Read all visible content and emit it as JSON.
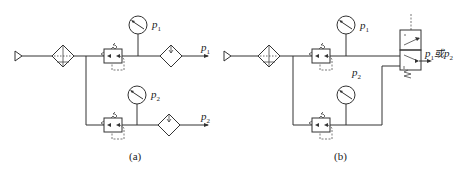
{
  "diagram": {
    "type": "pneumatic-circuit",
    "panels": [
      {
        "id": "a",
        "caption": "(a)",
        "components": [
          "air-source",
          "filter",
          "pressure-regulator-1",
          "pressure-gauge-1",
          "lubricator-1",
          "pressure-regulator-2",
          "pressure-gauge-2",
          "lubricator-2"
        ],
        "labels": {
          "gauge1": "p",
          "gauge1_sub": "1",
          "out1": "p",
          "out1_sub": "1",
          "gauge2": "p",
          "gauge2_sub": "2",
          "out2": "p",
          "out2_sub": "2"
        }
      },
      {
        "id": "b",
        "caption": "(b)",
        "components": [
          "air-source",
          "filter",
          "pressure-regulator-1",
          "pressure-gauge-1",
          "pressure-regulator-2",
          "pressure-gauge-2",
          "directional-valve"
        ],
        "labels": {
          "gauge1": "p",
          "gauge1_sub": "1",
          "gauge2": "p",
          "gauge2_sub": "2",
          "out_p1": "p",
          "out_p1_sub": "1",
          "out_or": "或",
          "out_p2": "p",
          "out_p2_sub": "2"
        }
      }
    ]
  }
}
